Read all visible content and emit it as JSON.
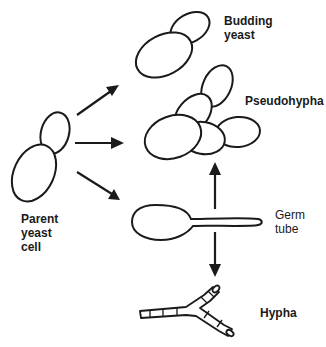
{
  "diagram": {
    "colors": {
      "ink": "#1a1a1a",
      "background": "#ffffff"
    },
    "nodes": {
      "parent": {
        "lines": [
          "Parent",
          "yeast",
          "cell"
        ]
      },
      "budding": {
        "lines": [
          "Budding",
          "yeast"
        ]
      },
      "pseudohypha": {
        "lines": [
          "Pseudohypha"
        ]
      },
      "germ_tube": {
        "lines": [
          "Germ",
          "tube"
        ]
      },
      "hypha": {
        "lines": [
          "Hypha"
        ]
      }
    },
    "edges": [
      {
        "from": "parent",
        "to": "budding"
      },
      {
        "from": "parent",
        "to": "pseudohypha"
      },
      {
        "from": "parent",
        "to": "germ_tube"
      },
      {
        "from": "germ_tube",
        "to": "pseudohypha"
      },
      {
        "from": "germ_tube",
        "to": "hypha"
      }
    ]
  }
}
